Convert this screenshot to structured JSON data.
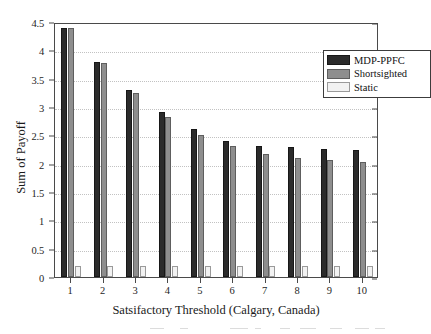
{
  "chart_data": {
    "type": "bar",
    "title": "",
    "xlabel": "Satsifactory Threshold (Calgary, Canada)",
    "ylabel": "Sum of Payoff",
    "categories": [
      "1",
      "2",
      "3",
      "4",
      "5",
      "6",
      "7",
      "8",
      "9",
      "10"
    ],
    "ylim": [
      0,
      4.5
    ],
    "ytick_labels": [
      "0",
      "0.5",
      "1",
      "1.5",
      "2",
      "2.5",
      "3",
      "3.5",
      "4",
      "4.5"
    ],
    "ytick_values": [
      0,
      0.5,
      1,
      1.5,
      2,
      2.5,
      3,
      3.5,
      4,
      4.5
    ],
    "grid": true,
    "grid_axis": "y",
    "legend_position": "top-right",
    "series": [
      {
        "name": "MDP-PPFC",
        "color": "#2b2b2b",
        "values": [
          4.4,
          3.79,
          3.3,
          2.91,
          2.61,
          2.4,
          2.32,
          2.29,
          2.26,
          2.25
        ]
      },
      {
        "name": "Shortsighted",
        "color": "#8e8e8e",
        "values": [
          4.4,
          3.78,
          3.24,
          2.83,
          2.51,
          2.31,
          2.17,
          2.1,
          2.07,
          2.03
        ]
      },
      {
        "name": "Static",
        "color": "#f2f2f2",
        "values": [
          0.19,
          0.19,
          0.19,
          0.19,
          0.19,
          0.19,
          0.19,
          0.19,
          0.19,
          0.19
        ]
      }
    ]
  },
  "legend": {
    "items": [
      {
        "label": "MDP-PPFC"
      },
      {
        "label": "Shortsighted"
      },
      {
        "label": "Static"
      }
    ]
  }
}
